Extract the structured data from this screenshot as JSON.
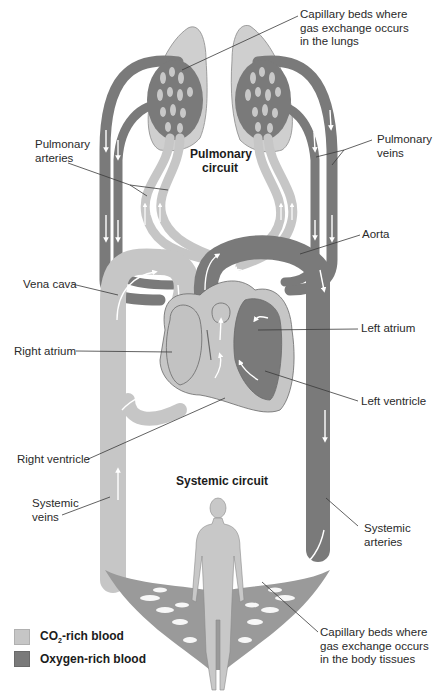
{
  "colors": {
    "co2_rich": "#c6c6c6",
    "oxygen_rich": "#7a7a7a",
    "lung_tissue": "#cfcfcf",
    "body": "#c8c8c8",
    "outline": "#6a6a6a",
    "leader_line": "#3a3a3a",
    "flow_arrow": "#ffffff"
  },
  "circuits": {
    "pulmonary": [
      "Pulmonary",
      "circuit"
    ],
    "systemic": "Systemic circuit"
  },
  "labels": {
    "capillary_lungs": [
      "Capillary beds where",
      "gas exchange occurs",
      "in the lungs"
    ],
    "pulmonary_arteries": [
      "Pulmonary",
      "arteries"
    ],
    "pulmonary_veins": [
      "Pulmonary",
      "veins"
    ],
    "aorta": "Aorta",
    "vena_cava": "Vena cava",
    "left_atrium": "Left atrium",
    "right_atrium": "Right atrium",
    "left_ventricle": "Left ventricle",
    "right_ventricle": "Right ventricle",
    "systemic_veins": [
      "Systemic",
      "veins"
    ],
    "systemic_arteries": [
      "Systemic",
      "arteries"
    ],
    "capillary_body": [
      "Capillary beds where",
      "gas exchange occurs",
      "in the body tissues"
    ]
  },
  "legend": {
    "items": [
      {
        "key": "co2_rich",
        "prefix": "CO",
        "subscript": "2",
        "suffix": "-rich blood"
      },
      {
        "key": "oxygen_rich",
        "label": "Oxygen-rich blood"
      }
    ]
  }
}
